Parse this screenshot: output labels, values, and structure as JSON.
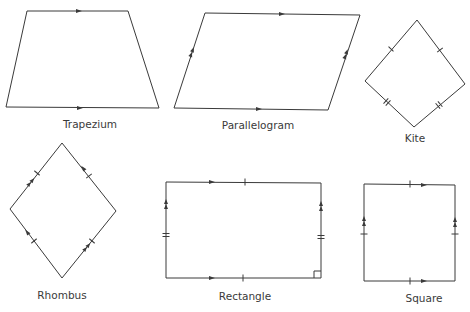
{
  "figure": {
    "shapes": [
      {
        "id": "trapezium",
        "label": "Trapezium",
        "properties": [
          "one pair of parallel sides"
        ]
      },
      {
        "id": "parallelogram",
        "label": "Parallelogram",
        "properties": [
          "two pairs of parallel sides"
        ]
      },
      {
        "id": "kite",
        "label": "Kite",
        "properties": [
          "two pairs of equal adjacent sides"
        ]
      },
      {
        "id": "rhombus",
        "label": "Rhombus",
        "properties": [
          "four equal sides",
          "two pairs of parallel sides"
        ]
      },
      {
        "id": "rectangle",
        "label": "Rectangle",
        "properties": [
          "opposite sides equal",
          "two pairs of parallel sides",
          "right angle"
        ]
      },
      {
        "id": "square",
        "label": "Square",
        "properties": [
          "four equal sides",
          "two pairs of parallel sides"
        ]
      }
    ]
  }
}
